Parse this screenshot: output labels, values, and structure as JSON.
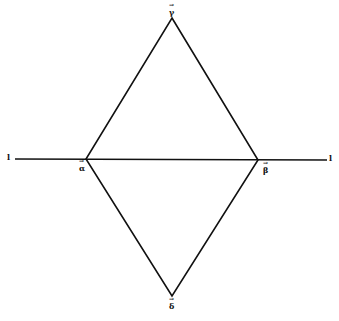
{
  "diagram": {
    "type": "rhombus-with-line",
    "line": {
      "left_label": "l",
      "right_label": "l",
      "x1": 15,
      "x2": 327,
      "y": 159
    },
    "vertices": {
      "top": {
        "label": "γ",
        "x": 172,
        "y": 18
      },
      "left": {
        "label": "α",
        "x": 86,
        "y": 159
      },
      "right": {
        "label": "β",
        "x": 258,
        "y": 160
      },
      "bottom": {
        "label": "δ",
        "x": 172,
        "y": 296
      }
    },
    "stroke_color": "#111111",
    "background": "#ffffff"
  }
}
